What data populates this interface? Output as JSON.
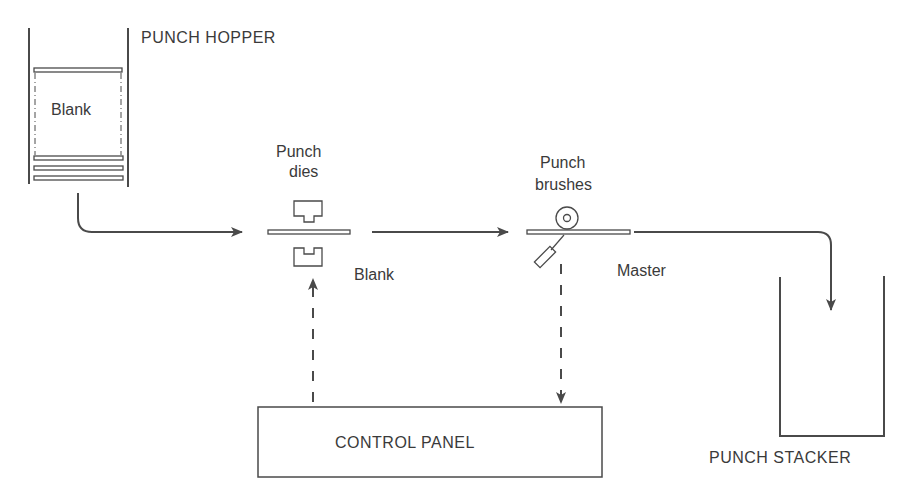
{
  "diagram": {
    "type": "process-flow",
    "nodes": {
      "punch_hopper": {
        "label": "PUNCH HOPPER",
        "contents_label": "Blank"
      },
      "punch_dies": {
        "label_line1": "Punch",
        "label_line2": "dies",
        "card_label": "Blank"
      },
      "punch_brushes": {
        "label_line1": "Punch",
        "label_line2": "brushes",
        "card_label": "Master"
      },
      "punch_stacker": {
        "label": "PUNCH STACKER"
      },
      "control_panel": {
        "label": "CONTROL PANEL"
      }
    },
    "edges": [
      {
        "from": "punch_hopper",
        "to": "punch_dies",
        "style": "solid"
      },
      {
        "from": "punch_dies",
        "to": "punch_brushes",
        "style": "solid"
      },
      {
        "from": "punch_brushes",
        "to": "punch_stacker",
        "style": "solid"
      },
      {
        "from": "punch_brushes",
        "to": "control_panel",
        "style": "dashed"
      },
      {
        "from": "control_panel",
        "to": "punch_dies",
        "style": "dashed"
      }
    ],
    "colors": {
      "ink": "#4a4a4a",
      "text": "#3a3a3a",
      "background": "#ffffff"
    }
  }
}
